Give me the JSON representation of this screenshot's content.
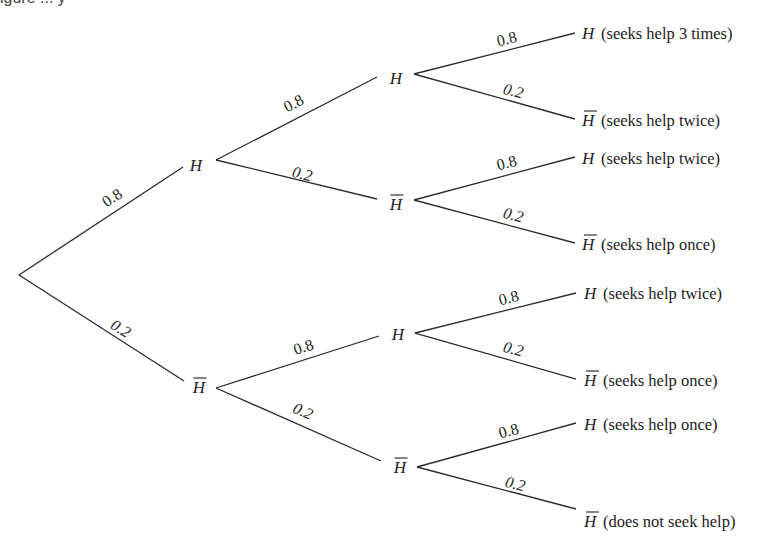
{
  "caption_fragment": "igure ... y",
  "diagram": {
    "type": "probability-tree",
    "event_symbol": "H",
    "complement_symbol": "H̄",
    "root": {
      "x": 19,
      "y": 275
    },
    "nodes": [
      {
        "id": "L1-H",
        "label": "H",
        "complement": false,
        "tx": 196,
        "ty": 171,
        "in": [
          183,
          167
        ],
        "out": [
          216,
          160
        ]
      },
      {
        "id": "L1-Hb",
        "label": "H",
        "complement": true,
        "tx": 199,
        "ty": 393,
        "in": [
          184,
          381
        ],
        "out": [
          216,
          388
        ]
      },
      {
        "id": "L2-H-H",
        "label": "H",
        "complement": false,
        "tx": 396,
        "ty": 84,
        "in": [
          377,
          77
        ],
        "out": [
          414,
          74
        ]
      },
      {
        "id": "L2-H-Hb",
        "label": "H",
        "complement": true,
        "tx": 396,
        "ty": 210,
        "in": [
          377,
          199
        ],
        "out": [
          414,
          200
        ]
      },
      {
        "id": "L2-Hb-H",
        "label": "H",
        "complement": false,
        "tx": 398,
        "ty": 340,
        "in": [
          379,
          336
        ],
        "out": [
          415,
          333
        ]
      },
      {
        "id": "L2-Hb-Hb",
        "label": "H",
        "complement": true,
        "tx": 400,
        "ty": 473,
        "in": [
          381,
          461
        ],
        "out": [
          417,
          467
        ]
      }
    ],
    "edges": [
      {
        "from": [
          19,
          275
        ],
        "to": [
          183,
          167
        ],
        "prob": "0.8",
        "lx": 115,
        "ly": 202,
        "angle": -33,
        "italic": false
      },
      {
        "from": [
          19,
          275
        ],
        "to": [
          184,
          381
        ],
        "prob": "0.2",
        "lx": 118,
        "ly": 333,
        "angle": 32,
        "italic": true
      },
      {
        "from": [
          216,
          160
        ],
        "to": [
          377,
          77
        ],
        "prob": "0.8",
        "lx": 296,
        "ly": 108,
        "angle": -27,
        "italic": false
      },
      {
        "from": [
          216,
          160
        ],
        "to": [
          377,
          199
        ],
        "prob": "0.2",
        "lx": 301,
        "ly": 179,
        "angle": 14,
        "italic": true
      },
      {
        "from": [
          216,
          388
        ],
        "to": [
          379,
          336
        ],
        "prob": "0.8",
        "lx": 305,
        "ly": 352,
        "angle": -18,
        "italic": false
      },
      {
        "from": [
          216,
          388
        ],
        "to": [
          381,
          461
        ],
        "prob": "0.2",
        "lx": 301,
        "ly": 416,
        "angle": 24,
        "italic": true
      },
      {
        "from": [
          414,
          74
        ],
        "to": [
          575,
          33
        ],
        "prob": "0.8",
        "lx": 508,
        "ly": 44,
        "angle": -14,
        "italic": false
      },
      {
        "from": [
          414,
          74
        ],
        "to": [
          575,
          119
        ],
        "prob": "0.2",
        "lx": 512,
        "ly": 96,
        "angle": 15,
        "italic": true
      },
      {
        "from": [
          414,
          200
        ],
        "to": [
          575,
          157
        ],
        "prob": "0.8",
        "lx": 508,
        "ly": 168,
        "angle": -15,
        "italic": false
      },
      {
        "from": [
          414,
          200
        ],
        "to": [
          575,
          243
        ],
        "prob": "0.2",
        "lx": 512,
        "ly": 220,
        "angle": 15,
        "italic": true
      },
      {
        "from": [
          415,
          333
        ],
        "to": [
          576,
          293
        ],
        "prob": "0.8",
        "lx": 510,
        "ly": 303,
        "angle": -14,
        "italic": false
      },
      {
        "from": [
          415,
          333
        ],
        "to": [
          576,
          379
        ],
        "prob": "0.2",
        "lx": 512,
        "ly": 354,
        "angle": 15,
        "italic": true
      },
      {
        "from": [
          417,
          467
        ],
        "to": [
          576,
          423
        ],
        "prob": "0.8",
        "lx": 510,
        "ly": 436,
        "angle": -15,
        "italic": false
      },
      {
        "from": [
          417,
          467
        ],
        "to": [
          576,
          509
        ],
        "prob": "0.2",
        "lx": 514,
        "ly": 489,
        "angle": 14,
        "italic": true
      }
    ],
    "leaves": [
      {
        "label": "H",
        "complement": false,
        "desc": "(seeks help 3 times)",
        "x": 582,
        "y": 39
      },
      {
        "label": "H",
        "complement": true,
        "desc": "(seeks help twice)",
        "x": 582,
        "y": 126
      },
      {
        "label": "H",
        "complement": false,
        "desc": "(seeks help twice)",
        "x": 582,
        "y": 164
      },
      {
        "label": "H",
        "complement": true,
        "desc": "(seeks help once)",
        "x": 582,
        "y": 250
      },
      {
        "label": "H",
        "complement": false,
        "desc": "(seeks help twice)",
        "x": 584,
        "y": 299
      },
      {
        "label": "H",
        "complement": true,
        "desc": "(seeks help once)",
        "x": 584,
        "y": 386
      },
      {
        "label": "H",
        "complement": false,
        "desc": "(seeks help once)",
        "x": 584,
        "y": 430
      },
      {
        "label": "H",
        "complement": true,
        "desc": "(does not seek help)",
        "x": 584,
        "y": 527
      }
    ],
    "probabilities": {
      "help": "0.8",
      "no_help": "0.2"
    },
    "line_color": "#2b2b2b",
    "text_color": "#222222",
    "background": "#ffffff"
  }
}
